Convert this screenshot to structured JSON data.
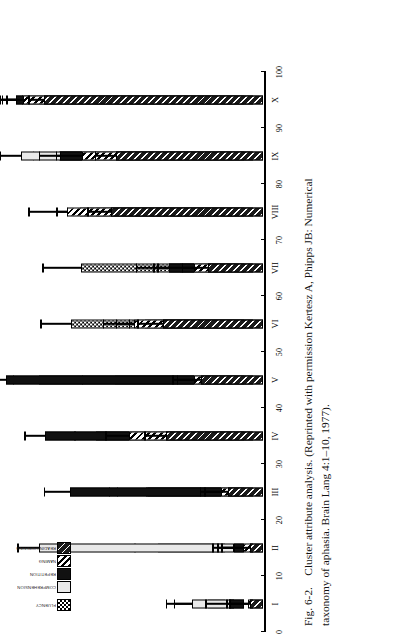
{
  "figure": {
    "number": "Fig. 6-2.",
    "caption_line1": "Cluster attribute analysis. (Reprinted with permission Kertesz A, Phipps JB: Numerical",
    "caption_line2": "taxonomy of aphasia. Brain Lang 4:1–10, 1977)."
  },
  "legend": {
    "items": [
      {
        "label": "FLUENCY",
        "pattern": "p-check"
      },
      {
        "label": "COMPREHENSION",
        "pattern": "p-light"
      },
      {
        "label": "REPETITION",
        "pattern": "p-solid"
      },
      {
        "label": "NAMING",
        "pattern": "p-hatch"
      },
      {
        "label": "READING/WRITING",
        "pattern": "p-dkhatch"
      }
    ]
  },
  "chart_data": {
    "type": "bar",
    "title": "Cluster attribute analysis",
    "xlabel": "Cluster",
    "ylabel": "Score",
    "ylim": [
      0,
      100
    ],
    "yticks": [
      0,
      10,
      20,
      30,
      40,
      50,
      60,
      70,
      80,
      90,
      100
    ],
    "ytick_labels": [
      "0",
      "10",
      "20",
      "30",
      "40",
      "50",
      "60",
      "70",
      "80",
      "90",
      "100"
    ],
    "grid": false,
    "legend_position": "top-left",
    "orientation": "vertical-bars-printed-sideways",
    "categories": [
      "I",
      "II",
      "III",
      "IV",
      "V",
      "VI",
      "VII",
      "VIII",
      "IX",
      "X"
    ],
    "series": [
      {
        "name": "FLUENCY",
        "pattern": "p-check",
        "values": [
          7,
          27,
          32,
          28,
          75,
          62,
          58,
          29,
          67,
          82
        ],
        "errors": [
          13,
          9,
          11,
          10,
          10,
          12,
          15,
          9,
          10,
          11
        ]
      },
      {
        "name": "COMPREHENSION",
        "pattern": "p-light",
        "values": [
          17,
          79,
          35,
          56,
          48,
          31,
          22,
          56,
          86,
          85
        ],
        "errors": [
          10,
          8,
          15,
          8,
          13,
          11,
          10,
          11,
          8,
          9
        ]
      },
      {
        "name": "REPETITION",
        "pattern": "p-solid",
        "values": [
          6,
          4,
          70,
          80,
          96,
          40,
          30,
          66,
          74,
          92
        ],
        "errors": [
          9,
          8,
          10,
          8,
          6,
          11,
          13,
          9,
          8,
          5
        ]
      },
      {
        "name": "NAMING",
        "pattern": "p-hatch",
        "values": [
          2,
          4,
          13,
          50,
          24,
          48,
          24,
          75,
          69,
          93
        ],
        "errors": [
          7,
          10,
          8,
          9,
          8,
          12,
          14,
          15,
          10,
          6
        ]
      },
      {
        "name": "READING/WRITING",
        "pattern": "p-dkhatch",
        "values": [
          5,
          5,
          14,
          39,
          25,
          40,
          22,
          61,
          59,
          88
        ],
        "errors": [
          9,
          11,
          9,
          8,
          9,
          10,
          10,
          9,
          8,
          6
        ]
      }
    ]
  }
}
